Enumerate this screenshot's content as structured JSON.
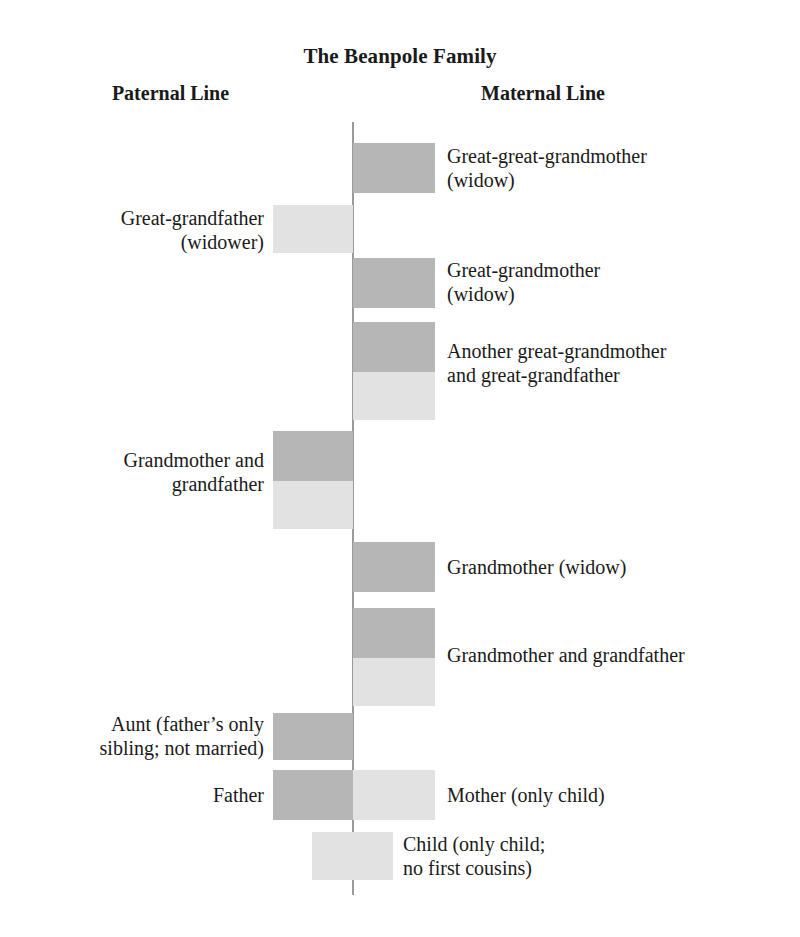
{
  "figure": {
    "title": "The Beanpole Family",
    "columns": {
      "paternal": "Paternal Line",
      "maternal": "Maternal Line"
    },
    "colors": {
      "female": "#b6b6b6",
      "male": "#e2e2e2",
      "axis": "#9a9a9a",
      "background": "#ffffff",
      "text": "#1a1a1a"
    }
  },
  "generations": [
    {
      "id": "great-great-grandparents",
      "side": "maternal",
      "label": "Great-great-grandmother\n(widow)",
      "segments": [
        {
          "sex": "female",
          "note": "widow"
        }
      ]
    },
    {
      "id": "paternal-great-grandfather",
      "side": "paternal",
      "label": "Great-grandfather\n(widower)",
      "segments": [
        {
          "sex": "male",
          "note": "widower"
        }
      ]
    },
    {
      "id": "maternal-great-grandmother",
      "side": "maternal",
      "label": "Great-grandmother\n(widow)",
      "segments": [
        {
          "sex": "female",
          "note": "widow"
        }
      ]
    },
    {
      "id": "maternal-great-grandparents-couple",
      "side": "maternal",
      "label": "Another great-grandmother\nand great-grandfather",
      "segments": [
        {
          "sex": "female"
        },
        {
          "sex": "male"
        }
      ]
    },
    {
      "id": "paternal-grandparents-couple",
      "side": "paternal",
      "label": "Grandmother and\ngrandfather",
      "segments": [
        {
          "sex": "female"
        },
        {
          "sex": "male"
        }
      ]
    },
    {
      "id": "maternal-grandmother-widow",
      "side": "maternal",
      "label": "Grandmother (widow)",
      "segments": [
        {
          "sex": "female",
          "note": "widow"
        }
      ]
    },
    {
      "id": "maternal-grandparents-couple",
      "side": "maternal",
      "label": "Grandmother and grandfather",
      "segments": [
        {
          "sex": "female"
        },
        {
          "sex": "male"
        }
      ]
    },
    {
      "id": "aunt",
      "side": "paternal",
      "label": "Aunt (father’s only\nsibling; not married)",
      "segments": [
        {
          "sex": "female"
        }
      ]
    },
    {
      "id": "parents",
      "side": "both",
      "label_left": "Father",
      "label_right": "Mother (only child)",
      "segments": [
        {
          "sex": "female",
          "position": "left"
        },
        {
          "sex": "male",
          "position": "right"
        }
      ]
    },
    {
      "id": "child",
      "side": "center",
      "label": "Child (only child;\nno first cousins)",
      "segments": [
        {
          "sex": "male"
        }
      ]
    }
  ]
}
